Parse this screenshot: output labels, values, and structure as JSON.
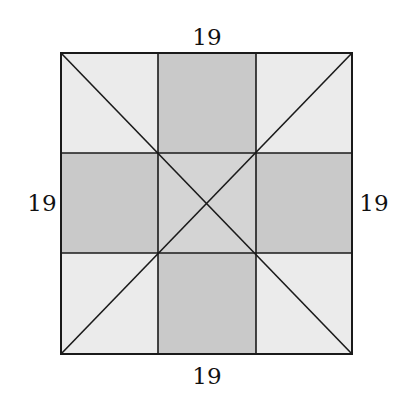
{
  "diagram": {
    "labels": {
      "top": "19",
      "bottom": "19",
      "left": "19",
      "right": "19"
    },
    "colors": {
      "light": "#ebebeb",
      "dark": "#c9c9c9",
      "center": "#d4d4d4",
      "stroke": "#1a1a1a"
    },
    "grid": "3x3 square divided into 9 cells with both diagonals drawn"
  }
}
